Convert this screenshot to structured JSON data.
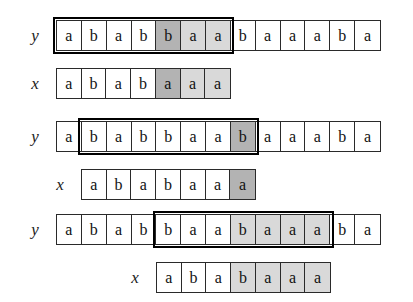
{
  "figure": {
    "alphabet": [
      "a",
      "b"
    ],
    "background_color": "#ffffff",
    "ink_color": "#111111",
    "shade_dark_color": "#b3b3b3",
    "shade_light_color": "#d9d9d9",
    "label_y": "y",
    "label_x": "x",
    "y_sequence": [
      "a",
      "b",
      "a",
      "b",
      "b",
      "a",
      "a",
      "b",
      "a",
      "a",
      "a",
      "b",
      "a"
    ],
    "x_sequence": [
      "a",
      "b",
      "a",
      "b",
      "a",
      "a",
      "a"
    ],
    "groups": [
      {
        "name": "alignment-step-1",
        "y_row": {
          "label": "y",
          "cells": [
            {
              "char": "a",
              "shade": "none"
            },
            {
              "char": "b",
              "shade": "none"
            },
            {
              "char": "a",
              "shade": "none"
            },
            {
              "char": "b",
              "shade": "none"
            },
            {
              "char": "b",
              "shade": "dark"
            },
            {
              "char": "a",
              "shade": "light"
            },
            {
              "char": "a",
              "shade": "light"
            },
            {
              "char": "b",
              "shade": "none"
            },
            {
              "char": "a",
              "shade": "none"
            },
            {
              "char": "a",
              "shade": "none"
            },
            {
              "char": "a",
              "shade": "none"
            },
            {
              "char": "b",
              "shade": "none"
            },
            {
              "char": "a",
              "shade": "none"
            }
          ]
        },
        "x_row": {
          "label": "x",
          "offset_cells": 0,
          "cells": [
            {
              "char": "a",
              "shade": "none"
            },
            {
              "char": "b",
              "shade": "none"
            },
            {
              "char": "a",
              "shade": "none"
            },
            {
              "char": "b",
              "shade": "none"
            },
            {
              "char": "a",
              "shade": "dark"
            },
            {
              "char": "a",
              "shade": "light"
            },
            {
              "char": "a",
              "shade": "light"
            }
          ]
        },
        "highlight": {
          "start_cell": 0,
          "length_cells": 7
        }
      },
      {
        "name": "alignment-step-2",
        "y_row": {
          "label": "y",
          "cells": [
            {
              "char": "a",
              "shade": "none"
            },
            {
              "char": "b",
              "shade": "none"
            },
            {
              "char": "a",
              "shade": "none"
            },
            {
              "char": "b",
              "shade": "none"
            },
            {
              "char": "b",
              "shade": "none"
            },
            {
              "char": "a",
              "shade": "none"
            },
            {
              "char": "a",
              "shade": "none"
            },
            {
              "char": "b",
              "shade": "dark"
            },
            {
              "char": "a",
              "shade": "none"
            },
            {
              "char": "a",
              "shade": "none"
            },
            {
              "char": "a",
              "shade": "none"
            },
            {
              "char": "b",
              "shade": "none"
            },
            {
              "char": "a",
              "shade": "none"
            }
          ]
        },
        "x_row": {
          "label": "x",
          "offset_cells": 1,
          "cells": [
            {
              "char": "a",
              "shade": "none"
            },
            {
              "char": "b",
              "shade": "none"
            },
            {
              "char": "a",
              "shade": "none"
            },
            {
              "char": "b",
              "shade": "none"
            },
            {
              "char": "a",
              "shade": "none"
            },
            {
              "char": "a",
              "shade": "none"
            },
            {
              "char": "a",
              "shade": "dark"
            }
          ]
        },
        "highlight": {
          "start_cell": 1,
          "length_cells": 7
        }
      },
      {
        "name": "alignment-step-3",
        "y_row": {
          "label": "y",
          "cells": [
            {
              "char": "a",
              "shade": "none"
            },
            {
              "char": "b",
              "shade": "none"
            },
            {
              "char": "a",
              "shade": "none"
            },
            {
              "char": "b",
              "shade": "none"
            },
            {
              "char": "b",
              "shade": "none"
            },
            {
              "char": "a",
              "shade": "none"
            },
            {
              "char": "a",
              "shade": "none"
            },
            {
              "char": "b",
              "shade": "light"
            },
            {
              "char": "a",
              "shade": "light"
            },
            {
              "char": "a",
              "shade": "light"
            },
            {
              "char": "a",
              "shade": "light"
            },
            {
              "char": "b",
              "shade": "none"
            },
            {
              "char": "a",
              "shade": "none"
            }
          ]
        },
        "x_row": {
          "label": "x",
          "offset_cells": 4,
          "cells": [
            {
              "char": "a",
              "shade": "none"
            },
            {
              "char": "b",
              "shade": "none"
            },
            {
              "char": "a",
              "shade": "none"
            },
            {
              "char": "b",
              "shade": "light"
            },
            {
              "char": "a",
              "shade": "light"
            },
            {
              "char": "a",
              "shade": "light"
            },
            {
              "char": "a",
              "shade": "light"
            }
          ]
        },
        "highlight": {
          "start_cell": 4,
          "length_cells": 7
        }
      }
    ],
    "geometry": {
      "cell_width": 25,
      "row_height": 31,
      "strip_left": 56,
      "group_tops": [
        20,
        121,
        214
      ],
      "x_row_offset_y": 48
    }
  }
}
